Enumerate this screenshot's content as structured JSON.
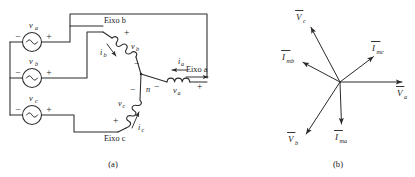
{
  "figure": {
    "line_color": "#2b2b2b",
    "background": "#ffffff"
  },
  "panel_a": {
    "caption": "(a)",
    "axis_labels": {
      "axis_b": "Eixo b",
      "axis_c": "Eixo c",
      "axis_a": "Eixo a"
    },
    "sources": [
      {
        "name": "source-va",
        "label": "v",
        "subscript": "a",
        "minus": "−",
        "plus": "+"
      },
      {
        "name": "source-vb",
        "label": "v",
        "subscript": "b",
        "minus": "−",
        "plus": "+"
      },
      {
        "name": "source-vc",
        "label": "v",
        "subscript": "c",
        "minus": "−",
        "plus": "+"
      }
    ],
    "coils": [
      {
        "name": "coil-vb",
        "label": "v",
        "subscript": "b",
        "near_sign": "+",
        "far_sign": "−"
      },
      {
        "name": "coil-vc",
        "label": "v",
        "subscript": "c",
        "near_sign": "+",
        "far_sign": "−"
      },
      {
        "name": "coil-va",
        "label": "v",
        "subscript": "a",
        "near_sign": "−",
        "far_sign": "+"
      }
    ],
    "currents": [
      {
        "name": "current-ia",
        "label": "i",
        "subscript": "a"
      },
      {
        "name": "current-ib",
        "label": "i",
        "subscript": "b"
      },
      {
        "name": "current-ic",
        "label": "i",
        "subscript": "c"
      }
    ],
    "neutral_node": "n"
  },
  "panel_b": {
    "caption": "(b)",
    "phasors": [
      {
        "name": "phasor-Va",
        "symbol": "V",
        "subscript": "a",
        "overbar": true,
        "angle_deg": 0,
        "length": 62,
        "label_dx": 8,
        "label_dy": 12
      },
      {
        "name": "phasor-Vb",
        "symbol": "V",
        "subscript": "b",
        "overbar": true,
        "angle_deg": 237,
        "length": 62,
        "label_dx": -18,
        "label_dy": 10
      },
      {
        "name": "phasor-Vc",
        "symbol": "V",
        "subscript": "c",
        "overbar": true,
        "angle_deg": 118,
        "length": 62,
        "label_dx": -12,
        "label_dy": -6
      },
      {
        "name": "phasor-Ima",
        "symbol": "I",
        "subscript": "ma",
        "overbar": true,
        "angle_deg": 272,
        "length": 42,
        "label_dx": -4,
        "label_dy": 13
      },
      {
        "name": "phasor-Imb",
        "symbol": "I",
        "subscript": "mb",
        "overbar": true,
        "angle_deg": 152,
        "length": 42,
        "label_dx": -20,
        "label_dy": -2
      },
      {
        "name": "phasor-Imc",
        "symbol": "I",
        "subscript": "mc",
        "overbar": true,
        "angle_deg": 37,
        "length": 42,
        "label_dx": -2,
        "label_dy": -8
      }
    ]
  }
}
